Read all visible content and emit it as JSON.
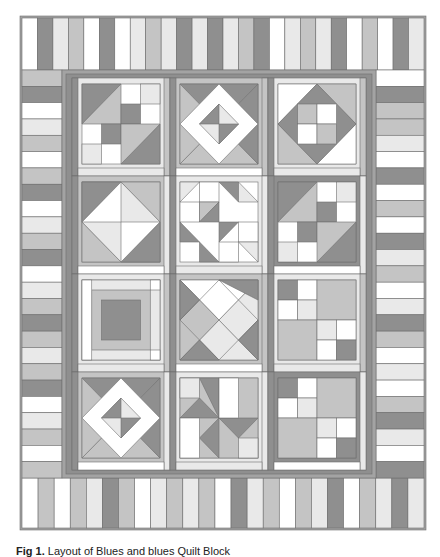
{
  "figure": {
    "caption_label": "Fig 1.",
    "caption_text": "Layout of Blues and blues Quilt Block"
  },
  "palette": {
    "white": "#ffffff",
    "light": "#e9e9e9",
    "mid": "#c4c4c4",
    "dark": "#8f8f8f",
    "sash": "#a3a3a3",
    "line": "#6f6f6f"
  },
  "quilt": {
    "outer": {
      "x": 20,
      "y": 16,
      "w": 406,
      "h": 514
    },
    "top_border": {
      "x": 22,
      "y": 18,
      "w": 402,
      "h": 52,
      "stripes": [
        "white",
        "dark",
        "light",
        "mid",
        "white",
        "dark",
        "white",
        "light",
        "mid",
        "light",
        "dark",
        "light",
        "dark",
        "light",
        "mid",
        "dark",
        "white",
        "light",
        "mid",
        "light",
        "dark",
        "white",
        "mid",
        "white",
        "dark",
        "light"
      ]
    },
    "bottom_border": {
      "x": 22,
      "y": 478,
      "w": 402,
      "h": 50,
      "stripes": [
        "white",
        "mid",
        "white",
        "mid",
        "light",
        "dark",
        "mid",
        "white",
        "light",
        "mid",
        "light",
        "mid",
        "white",
        "dark",
        "light",
        "mid",
        "white",
        "mid",
        "light",
        "dark",
        "white",
        "mid",
        "light",
        "dark",
        "light"
      ]
    },
    "left_border": {
      "x": 22,
      "y": 70,
      "w": 40,
      "h": 408,
      "stripes": [
        "mid",
        "dark",
        "white",
        "light",
        "mid",
        "white",
        "mid",
        "dark",
        "white",
        "light",
        "mid",
        "dark",
        "white",
        "light",
        "mid",
        "dark",
        "mid",
        "light",
        "mid",
        "dark",
        "white",
        "light",
        "mid",
        "white",
        "mid"
      ]
    },
    "right_border": {
      "x": 376,
      "y": 70,
      "w": 48,
      "h": 408,
      "stripes": [
        "white",
        "dark",
        "mid",
        "mid",
        "light",
        "white",
        "dark",
        "white",
        "mid",
        "white",
        "dark",
        "light",
        "mid",
        "white",
        "light",
        "dark",
        "mid",
        "white",
        "light",
        "white",
        "mid",
        "dark",
        "light",
        "white",
        "dark"
      ]
    },
    "center": {
      "x": 62,
      "y": 70,
      "w": 314,
      "h": 408
    }
  }
}
